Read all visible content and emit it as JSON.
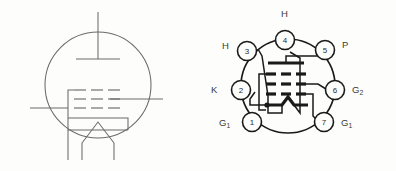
{
  "figure": {
    "background_color": "#fdfdfb",
    "line_color_schematic": "#6b6b6b",
    "line_color_socket": "#1a1a1a",
    "text_color": "#3a3a3a"
  },
  "schematic_symbol": {
    "name": "tube-schematic-symbol",
    "envelope": "circle",
    "electrodes": [
      {
        "name": "plate",
        "type": "anode-bar",
        "lead_direction": "up"
      },
      {
        "name": "grid-1",
        "type": "dashed-grid",
        "dashes": 3,
        "lead_direction": "left"
      },
      {
        "name": "grid-2",
        "type": "dashed-grid",
        "dashes": 3,
        "lead_direction": "right"
      },
      {
        "name": "grid-3",
        "type": "dashed-grid",
        "dashes": 3,
        "lead_direction": "left"
      },
      {
        "name": "cathode",
        "type": "cathode-bracket",
        "lead_direction": "down"
      },
      {
        "name": "heater",
        "type": "inverted-v-filament",
        "leads": 2
      }
    ]
  },
  "socket_diagram": {
    "name": "tube-base-pin-diagram",
    "pin_count": 7,
    "pins": [
      {
        "number": "1",
        "label": "G",
        "subscript": "1",
        "position": "bottom-left"
      },
      {
        "number": "2",
        "label": "K",
        "subscript": "",
        "position": "left"
      },
      {
        "number": "3",
        "label": "H",
        "subscript": "",
        "position": "upper-left"
      },
      {
        "number": "4",
        "label": "H",
        "subscript": "",
        "position": "top"
      },
      {
        "number": "5",
        "label": "P",
        "subscript": "",
        "position": "upper-right"
      },
      {
        "number": "6",
        "label": "G",
        "subscript": "2",
        "position": "right"
      },
      {
        "number": "7",
        "label": "G",
        "subscript": "1",
        "position": "bottom-right"
      }
    ],
    "internal_electrodes": [
      {
        "name": "plate",
        "type": "solid-bar",
        "connects_to_pin": "5"
      },
      {
        "name": "screen-grid",
        "type": "dashed-row",
        "dashes": 3,
        "connects_to_pin": "6"
      },
      {
        "name": "control-grid",
        "type": "dashed-row",
        "dashes": 3,
        "connects_to_pin": "1"
      },
      {
        "name": "suppressor-grid",
        "type": "dashed-row",
        "dashes": 3,
        "connects_to_pin": "7"
      },
      {
        "name": "cathode",
        "type": "solid-bar-with-dot",
        "connects_to_pin": "2"
      },
      {
        "name": "heater",
        "type": "inverted-v-filament",
        "connects_to_pins": "3 and 4"
      }
    ]
  }
}
